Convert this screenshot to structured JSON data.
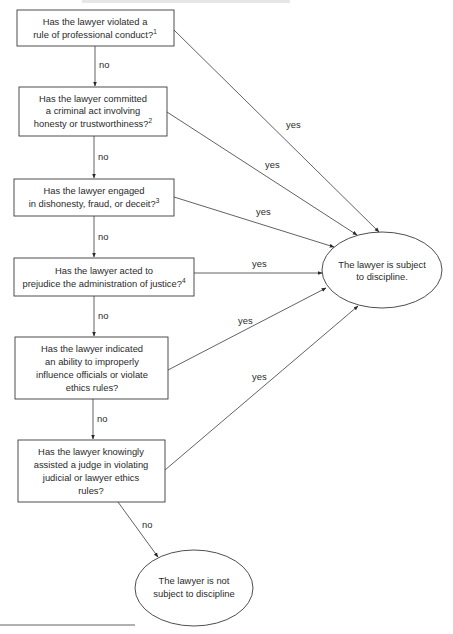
{
  "diagram": {
    "type": "flowchart",
    "questions": [
      {
        "id": "q1",
        "lines": [
          "Has the lawyer violated a",
          "rule of professional conduct?"
        ],
        "footnote": "1"
      },
      {
        "id": "q2",
        "lines": [
          "Has the lawyer committed",
          "a criminal act involving",
          "honesty or trustworthiness?"
        ],
        "footnote": "2"
      },
      {
        "id": "q3",
        "lines": [
          "Has the lawyer engaged",
          "in dishonesty, fraud, or deceit?"
        ],
        "footnote": "3"
      },
      {
        "id": "q4",
        "lines": [
          "Has the lawyer acted to",
          "prejudice the administration of justice?"
        ],
        "footnote": "4"
      },
      {
        "id": "q5",
        "lines": [
          "Has the lawyer indicated",
          "an ability to improperly",
          "influence officials or violate",
          "ethics rules?"
        ],
        "footnote": ""
      },
      {
        "id": "q6",
        "lines": [
          "Has the lawyer knowingly",
          "assisted a judge in violating",
          "judicial or lawyer ethics",
          "rules?"
        ],
        "footnote": ""
      }
    ],
    "outcomes": {
      "subject": {
        "lines": [
          "The lawyer is subject",
          "to discipline."
        ]
      },
      "not_subject": {
        "lines": [
          "The lawyer is not",
          "subject to discipline"
        ]
      }
    },
    "edge_labels": {
      "yes": "yes",
      "no": "no"
    }
  }
}
